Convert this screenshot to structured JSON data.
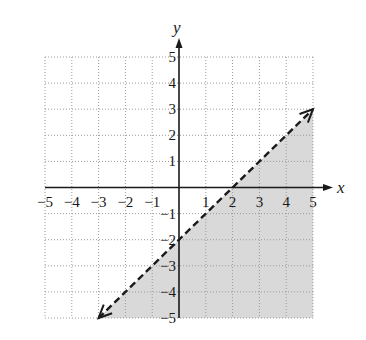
{
  "chart_data": {
    "type": "line",
    "title": "",
    "xlabel": "x",
    "ylabel": "y",
    "xlim": [
      -5,
      5
    ],
    "ylim": [
      -5,
      5
    ],
    "grid": true,
    "grid_style": "dotted",
    "x_ticks": [
      "-5",
      "-4",
      "-3",
      "-2",
      "-1",
      "1",
      "2",
      "3",
      "4",
      "5"
    ],
    "y_ticks": [
      "5",
      "4",
      "3",
      "2",
      "1",
      "-1",
      "-2",
      "-3",
      "-4",
      "-5"
    ],
    "series": [
      {
        "name": "boundary line y = x - 2",
        "style": "dashed",
        "arrows": "both",
        "x": [
          -3,
          5
        ],
        "y": [
          -5,
          3
        ]
      }
    ],
    "shaded_region": {
      "description": "region below the line (y < x - 2)",
      "vertices": [
        [
          -3,
          -5
        ],
        [
          5,
          3
        ],
        [
          5,
          -5
        ]
      ],
      "color": "#d9d9d9"
    },
    "key_points": {
      "x_intercept": [
        2,
        0
      ],
      "y_intercept": [
        0,
        -2
      ]
    }
  },
  "colors": {
    "axis": "#1a1a1a",
    "grid": "#9a9a9a",
    "shade": "#d9d9d9",
    "line": "#1a1a1a"
  }
}
